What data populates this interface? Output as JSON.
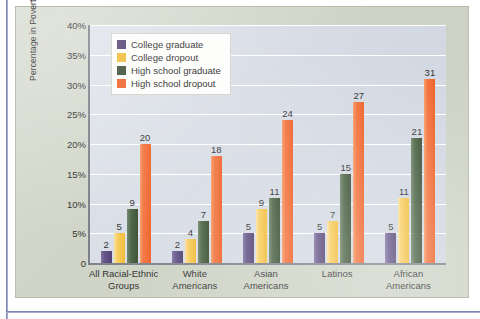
{
  "chart_data": {
    "type": "bar",
    "title": "",
    "xlabel": "",
    "ylabel": "Percentage in Poverty",
    "ylim": [
      0,
      40
    ],
    "ytick_labels": [
      "0",
      "5%",
      "10%",
      "15%",
      "20%",
      "25%",
      "30%",
      "35%",
      "40%"
    ],
    "ytick_values": [
      0,
      5,
      10,
      15,
      20,
      25,
      30,
      35,
      40
    ],
    "grid": true,
    "legend_position": "upper-left-inside",
    "categories": [
      "All Racial-Ethnic Groups",
      "White Americans",
      "Asian Americans",
      "Latinos",
      "African Americans"
    ],
    "category_lines": [
      [
        "All Racial-Ethnic",
        "Groups"
      ],
      [
        "White",
        "Americans"
      ],
      [
        "Asian",
        "Americans"
      ],
      [
        "Latinos",
        ""
      ],
      [
        "African",
        "Americans"
      ]
    ],
    "series": [
      {
        "name": "College graduate",
        "color": "#4b3c6e",
        "values": [
          2,
          2,
          5,
          5,
          5
        ],
        "labels": [
          "2",
          "2",
          "5",
          "5",
          "5"
        ]
      },
      {
        "name": "College dropout",
        "color": "#f0b92f",
        "values": [
          5,
          4,
          9,
          7,
          11
        ],
        "labels": [
          "5",
          "4",
          "9",
          "7",
          "11"
        ]
      },
      {
        "name": "High school graduate",
        "color": "#33482c",
        "values": [
          9,
          7,
          11,
          15,
          21
        ],
        "labels": [
          "9",
          "7",
          "11",
          "15",
          "21"
        ]
      },
      {
        "name": "High school dropout",
        "color": "#ed5c22",
        "values": [
          20,
          18,
          24,
          27,
          31
        ],
        "labels": [
          "20",
          "18",
          "24",
          "27",
          "31"
        ]
      }
    ]
  },
  "figure": {
    "background_color": "#cdd2c4",
    "plot_background_color": "#d6dbe4",
    "gridline_color": "#ffffff",
    "axis_color": "#7b7f86"
  }
}
